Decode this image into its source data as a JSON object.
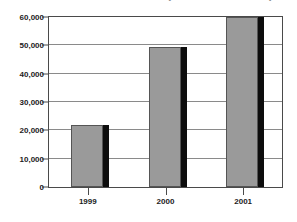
{
  "chart_data": {
    "type": "bar",
    "title": "(millions of dollars)",
    "subtitle": "",
    "xlabel": "",
    "ylabel": "",
    "categories": [
      "1999",
      "2000",
      "2001"
    ],
    "values": [
      21800,
      49500,
      60000
    ],
    "series": [
      {
        "name": "",
        "values": [
          21800,
          49500,
          60000
        ]
      }
    ],
    "ylim": [
      0,
      60000
    ],
    "ytick_values": [
      0,
      10000,
      20000,
      30000,
      40000,
      50000,
      60000
    ],
    "ytick_labels": [
      "0",
      "10,000",
      "20,000",
      "30,000",
      "40,000",
      "50,000",
      "60,000"
    ],
    "grid": true,
    "grid_axis": "y",
    "legend": false,
    "legend_position": "none",
    "bar_color": "#9a9a9a",
    "bar_edge_color": "#555555",
    "bar_shadow_color": "#0d0d0d",
    "gridline_color": "#8a8a8a",
    "axis_color": "#4a4a4a",
    "text_color": "#1c1c1c",
    "background_color": "#ffffff"
  }
}
